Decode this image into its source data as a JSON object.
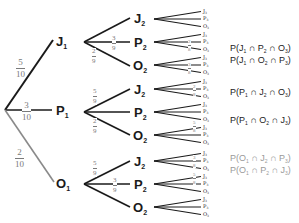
{
  "colors": {
    "dark": "#1a1a1a",
    "grey": "#8a8a8a",
    "fraction": "#7a7a7a",
    "prob_dark": "#222222",
    "prob_grey": "#9a9a9a"
  },
  "level1": [
    {
      "id": "J",
      "sub": "1",
      "prob_n": "5",
      "prob_d": "10"
    },
    {
      "id": "P",
      "sub": "1",
      "prob_n": "3",
      "prob_d": "10"
    },
    {
      "id": "O",
      "sub": "1",
      "prob_n": "2",
      "prob_d": "10"
    }
  ],
  "level2": [
    {
      "parent": "J1",
      "nodes": [
        {
          "id": "J",
          "sub": "2",
          "prob_n": "",
          "prob_d": ""
        },
        {
          "id": "P",
          "sub": "2",
          "prob_n": "3",
          "prob_d": "9"
        },
        {
          "id": "O",
          "sub": "2",
          "prob_n": "2",
          "prob_d": "9"
        }
      ]
    },
    {
      "parent": "P1",
      "nodes": [
        {
          "id": "J",
          "sub": "2",
          "prob_n": "5",
          "prob_d": "9"
        },
        {
          "id": "P",
          "sub": "2",
          "prob_n": "",
          "prob_d": ""
        },
        {
          "id": "O",
          "sub": "2",
          "prob_n": "2",
          "prob_d": "9"
        }
      ]
    },
    {
      "parent": "O1",
      "nodes": [
        {
          "id": "J",
          "sub": "2",
          "prob_n": "5",
          "prob_d": "9"
        },
        {
          "id": "P",
          "sub": "2",
          "prob_n": "3",
          "prob_d": "9"
        },
        {
          "id": "O",
          "sub": "2",
          "prob_n": "",
          "prob_d": ""
        }
      ]
    }
  ],
  "level3_labels": [
    "J",
    "P",
    "O"
  ],
  "level3_sub": "3",
  "level3_fractions": [
    {
      "branch": "J1-P2-O3",
      "n": "2",
      "d": "8"
    },
    {
      "branch": "J1-O2-P3",
      "n": "3",
      "d": "8"
    },
    {
      "branch": "P1-J2-O3",
      "n": "2",
      "d": "8"
    },
    {
      "branch": "P1-O2-J3",
      "n": "5",
      "d": "8"
    },
    {
      "branch": "O1-J2-P3",
      "n": "3",
      "d": "8"
    },
    {
      "branch": "O1-P2-J3",
      "n": "5",
      "d": "8"
    }
  ],
  "probabilities": [
    {
      "text": [
        "P(J",
        "1",
        " ∩ P",
        "2",
        " ∩ O",
        "3",
        ")"
      ],
      "color": "dark"
    },
    {
      "text": [
        "P(J",
        "1",
        " ∩ O",
        "2",
        " ∩ P",
        "3",
        ")"
      ],
      "color": "dark"
    },
    {
      "text": [
        "P(P",
        "1",
        " ∩ J",
        "2",
        " ∩ O",
        "3",
        ")"
      ],
      "color": "dark"
    },
    {
      "text": [
        "P(P",
        "1",
        " ∩ O",
        "2",
        " ∩ J",
        "3",
        ")"
      ],
      "color": "dark"
    },
    {
      "text": [
        "P(O",
        "1",
        " ∩ J",
        "2",
        " ∩ P",
        "3",
        ")"
      ],
      "color": "grey"
    },
    {
      "text": [
        "P(O",
        "1",
        " ∩ P",
        "2",
        " ∩ J",
        "3",
        ")"
      ],
      "color": "grey"
    }
  ]
}
